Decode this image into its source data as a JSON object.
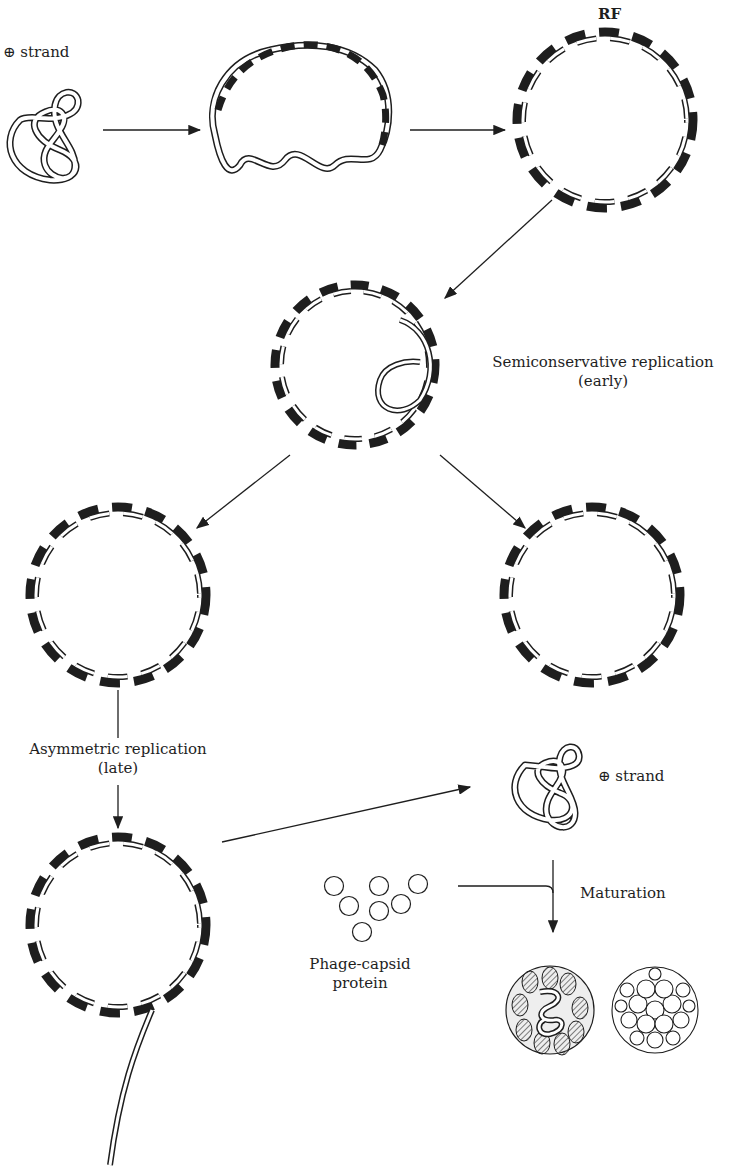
{
  "labels": {
    "plus_strand_top": "⊕ strand",
    "rf": "RF",
    "semiconservative": "Semiconservative replication",
    "semiconservative_sub": "(early)",
    "asymmetric": "Asymmetric replication",
    "asymmetric_sub": "(late)",
    "plus_strand_bottom": "⊕ strand",
    "maturation": "Maturation",
    "capsid_line1": "Phage-capsid",
    "capsid_line2": "protein"
  },
  "colors": {
    "ink": "#1e1e1e",
    "background": "#ffffff",
    "hatch": "#555555"
  }
}
